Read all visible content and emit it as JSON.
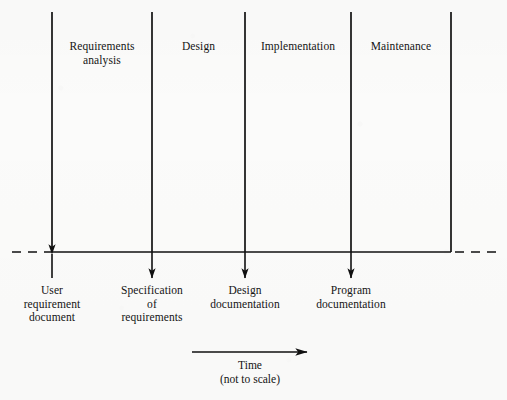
{
  "figure": {
    "title_text": "Software life cycle waterfall phases",
    "ink_color": "#111111",
    "paper_color": "#fbfbfa",
    "baseline_y": 252,
    "phase_line_top_y": 12
  },
  "phases": [
    {
      "label_line1": "Requirements",
      "label_line2": "analysis",
      "divider_x": 52,
      "center_x": 102
    },
    {
      "label_line1": "Design",
      "label_line2": "",
      "divider_x": 152,
      "center_x": 198
    },
    {
      "label_line1": "Implementation",
      "label_line2": "",
      "divider_x": 245,
      "center_x": 298
    },
    {
      "label_line1": "Maintenance",
      "label_line2": "",
      "divider_x": 351,
      "center_x": 400
    },
    {
      "label_line1": "",
      "label_line2": "",
      "divider_x": 451,
      "center_x": 451
    }
  ],
  "artifacts": [
    {
      "line1": "User",
      "line2": "requirement",
      "line3": "document",
      "x": 52,
      "arrow_direction": "up"
    },
    {
      "line1": "Specification",
      "line2": "of",
      "line3": "requirements",
      "x": 152,
      "arrow_direction": "down"
    },
    {
      "line1": "Design",
      "line2": "documentation",
      "line3": "",
      "x": 245,
      "arrow_direction": "down"
    },
    {
      "line1": "Program",
      "line2": "documentation",
      "line3": "",
      "x": 351,
      "arrow_direction": "down"
    }
  ],
  "time_axis": {
    "caption_line1": "Time",
    "caption_line2": "(not to scale)",
    "arrow_start_x": 192,
    "arrow_end_x": 307,
    "arrow_y": 352,
    "direction": "right"
  },
  "baseline": {
    "dash_left_start_x": 12,
    "dash_left_end_x": 52,
    "solid_start_x": 52,
    "solid_end_x": 451,
    "dash_right_start_x": 455,
    "dash_right_end_x": 498
  }
}
